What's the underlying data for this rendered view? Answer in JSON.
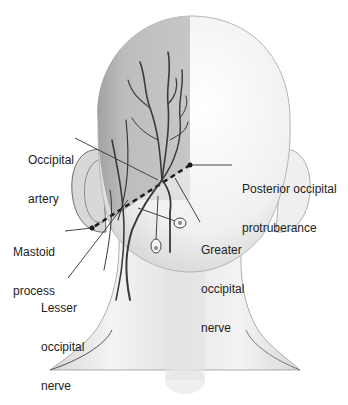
{
  "figure": {
    "labels": {
      "occipital_artery": [
        "Occipital",
        "artery"
      ],
      "posterior_occipital_protuberance": [
        "Posterior occipital",
        "protruberance"
      ],
      "mastoid_process": [
        "Mastoid",
        "process"
      ],
      "greater_occipital_nerve": [
        "Greater",
        "occipital",
        "nerve"
      ],
      "lesser_occipital_nerve": [
        "Lesser",
        "occipital",
        "nerve"
      ]
    },
    "colors": {
      "skin_light": "#f2f2f2",
      "skin_shaded": "#a8a8a8",
      "vessel": "#3a3a3a",
      "label_text": "#222222",
      "leader_line": "#333333"
    }
  }
}
